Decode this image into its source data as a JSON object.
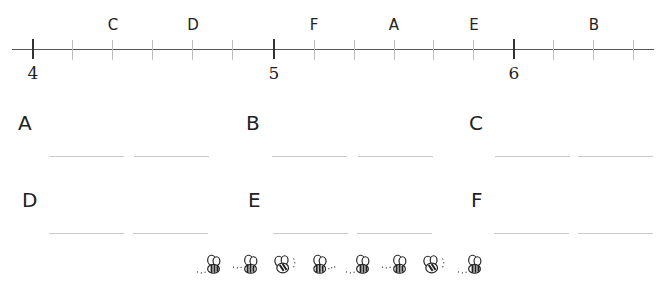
{
  "number_line": {
    "min": 4,
    "max": 6.6,
    "tick_step": 0.2,
    "major_labels": [
      {
        "value": 4,
        "label": "4",
        "x": 32
      },
      {
        "value": 5,
        "label": "5",
        "x": 273
      },
      {
        "value": 6,
        "label": "6",
        "x": 513
      }
    ],
    "points": [
      {
        "letter": "C",
        "value": 4.4,
        "x": 112
      },
      {
        "letter": "D",
        "value": 4.8,
        "x": 192
      },
      {
        "letter": "F",
        "value": 5.2,
        "x": 313
      },
      {
        "letter": "A",
        "value": 5.6,
        "x": 393
      },
      {
        "letter": "E",
        "value": 5.8,
        "x": 473
      },
      {
        "letter": "B",
        "value": 6.4,
        "x": 593
      }
    ]
  },
  "answers": [
    {
      "letter": "A",
      "blank1": "",
      "blank2": ""
    },
    {
      "letter": "B",
      "blank1": "",
      "blank2": ""
    },
    {
      "letter": "C",
      "blank1": "",
      "blank2": ""
    },
    {
      "letter": "D",
      "blank1": "",
      "blank2": ""
    },
    {
      "letter": "E",
      "blank1": "",
      "blank2": ""
    },
    {
      "letter": "F",
      "blank1": "",
      "blank2": ""
    }
  ],
  "decoration": {
    "icon": "bee-icon",
    "count": 8
  }
}
